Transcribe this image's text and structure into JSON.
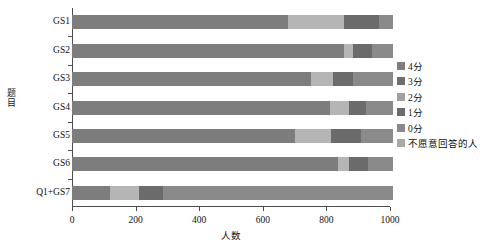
{
  "chart_data": {
    "type": "bar",
    "orientation": "horizontal",
    "stacked": true,
    "title": "",
    "xlabel": "人数",
    "ylabel": "题目",
    "xlim": [
      0,
      1000
    ],
    "xticks": [
      0,
      200,
      400,
      600,
      800,
      1000
    ],
    "xtick_labels": [
      "0",
      "200",
      "400",
      "600",
      "800",
      "1000"
    ],
    "grid": false,
    "legend_position": "right",
    "categories": [
      "GS1",
      "GS2",
      "GS3",
      "GS4",
      "GS5",
      "GS6",
      "Q1+GS7"
    ],
    "series": [
      {
        "name": "4分",
        "color": "#7d7d7d",
        "values": [
          680,
          855,
          750,
          810,
          700,
          835,
          120
        ]
      },
      {
        "name": "3分",
        "color": "#b5b5b5",
        "values": [
          175,
          30,
          70,
          60,
          115,
          35,
          90
        ]
      },
      {
        "name": "2分",
        "color": "#9a9a9a",
        "values": [
          0,
          0,
          0,
          0,
          0,
          0,
          0
        ]
      },
      {
        "name": "1分",
        "color": "#6b6b6b",
        "values": [
          110,
          60,
          65,
          55,
          95,
          60,
          75
        ]
      },
      {
        "name": "0分",
        "color": "#8a8a8a",
        "values": [
          45,
          65,
          125,
          85,
          100,
          80,
          725
        ]
      },
      {
        "name": "不愿意回答的人",
        "color": "#a8a8a8",
        "values": [
          0,
          0,
          0,
          0,
          0,
          0,
          0
        ]
      }
    ]
  },
  "legend": {
    "items": [
      {
        "label": "4分",
        "color": "#7d7d7d"
      },
      {
        "label": "3分",
        "color": "#6e6e6e"
      },
      {
        "label": "2分",
        "color": "#a0a0a0"
      },
      {
        "label": "1分",
        "color": "#6b6b6b"
      },
      {
        "label": "0分",
        "color": "#8a8a8a"
      },
      {
        "label": "不愿意回答的人",
        "color": "#a8a8a8"
      }
    ]
  },
  "axes": {
    "x_title": "人数",
    "y_title_chars": [
      "题",
      "目"
    ],
    "axis_color": "#4d4d4d"
  }
}
